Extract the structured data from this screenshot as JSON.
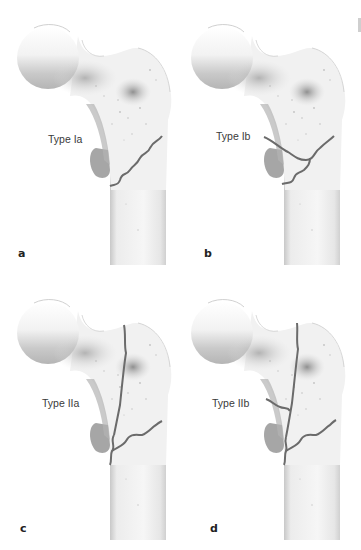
{
  "figure": {
    "panels": [
      {
        "letter": "a",
        "label": "Type Ia",
        "fracture": "single oblique wavy line across intertrochanteric region"
      },
      {
        "letter": "b",
        "label": "Type Ib",
        "fracture": "two wavy lines converging, isolating lesser trochanter fragment"
      },
      {
        "letter": "c",
        "label": "Type IIa",
        "fracture": "vertical line through greater trochanter plus transverse wavy line"
      },
      {
        "letter": "d",
        "label": "Type IIb",
        "fracture": "vertical line plus transverse line plus lesser trochanter fragment"
      }
    ]
  },
  "colors": {
    "background": "#ffffff",
    "bone_fill": "#f3f3f3",
    "bone_shadow": "#9a9a9a",
    "bone_outline": "#b8b8b8",
    "fracture_line": "#6b6b6b",
    "label_text": "#3a3a3a"
  }
}
